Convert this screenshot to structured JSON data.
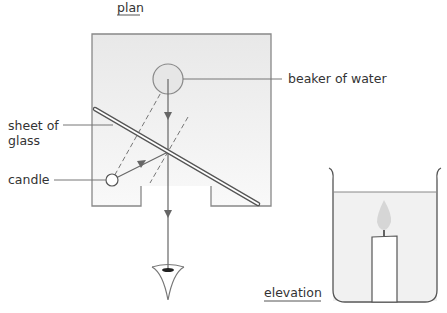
{
  "labels": {
    "plan": "plan",
    "beaker": "beaker of water",
    "glass_line1": "sheet of",
    "glass_line2": "glass",
    "candle": "candle",
    "elevation": "elevation"
  },
  "colors": {
    "line": "#777777",
    "box_fill_top": "#e9e9e9",
    "box_fill_bottom": "#f8f8f8",
    "text": "#333333"
  }
}
